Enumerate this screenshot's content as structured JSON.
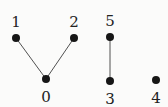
{
  "diagram": {
    "background_color": "#fbfbfa",
    "node_color": "#161616",
    "edge_color": "#3d3d3d",
    "label_color": "#222222",
    "node_radius": 4,
    "edge_width": 0.9,
    "nodes": [
      {
        "id": "0",
        "label": "0",
        "x": 46,
        "y": 79,
        "label_pos": "below"
      },
      {
        "id": "1",
        "label": "1",
        "x": 16,
        "y": 38,
        "label_pos": "above"
      },
      {
        "id": "2",
        "label": "2",
        "x": 74,
        "y": 38,
        "label_pos": "above"
      },
      {
        "id": "3",
        "label": "3",
        "x": 110,
        "y": 81,
        "label_pos": "below"
      },
      {
        "id": "4",
        "label": "4",
        "x": 156,
        "y": 80,
        "label_pos": "below"
      },
      {
        "id": "5",
        "label": "5",
        "x": 110,
        "y": 37,
        "label_pos": "above"
      }
    ],
    "edges": [
      {
        "from": "1",
        "to": "0"
      },
      {
        "from": "2",
        "to": "0"
      },
      {
        "from": "5",
        "to": "3"
      }
    ],
    "label_offset_above": -11,
    "label_offset_below": 23
  }
}
